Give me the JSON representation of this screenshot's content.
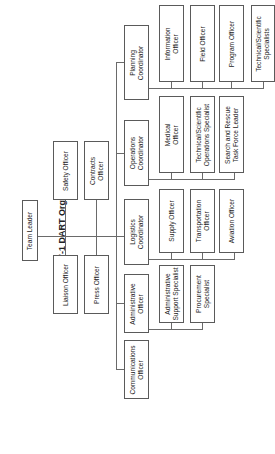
{
  "title": "Figure 7-1 DART Organization",
  "nodes": {
    "team_leader": "Team Leader",
    "liaison_officer": "Liaison Officer",
    "safety_officer": "Safety Officer",
    "press_officer": "Press Officer",
    "contracts_officer": "Contracts\nOfficer",
    "communications_officer": "Communications\nOfficer",
    "administrative_officer": "Administrative\nOfficer",
    "logistics_coordinator": "Logistics\nCoordinator",
    "operations_coordinator": "Operations\nCoordinator",
    "planning_coordinator": "Planning\nCoordinator",
    "admin_support_specialist": "Administrative\nSupport Specialist",
    "procurement_specialist": "Procurement\nSpecialist",
    "supply_officer": "Supply Officer",
    "transportation_officer": "Transportation\nOfficer",
    "aviation_officer": "Aviation Officer",
    "medical_officer": "Medical\nOfficer",
    "tech_sci_ops_specialist": "Technical/Scientific\nOperations Specialist",
    "sar_task_force_leader": "Search and Rescue\nTask Force Leader",
    "information_officer": "Information\nOfficer",
    "field_officer": "Field Officer",
    "program_officer": "Program Officer",
    "tech_sci_specialists": "Technical/Scientific\nSpecialists"
  },
  "hierarchy": {
    "root": "team_leader",
    "staff": [
      "liaison_officer",
      "safety_officer",
      "press_officer",
      "contracts_officer"
    ],
    "direct_reports": [
      "communications_officer",
      "administrative_officer",
      "logistics_coordinator",
      "operations_coordinator",
      "planning_coordinator"
    ],
    "children": {
      "administrative_officer": [
        "admin_support_specialist",
        "procurement_specialist"
      ],
      "logistics_coordinator": [
        "supply_officer",
        "transportation_officer",
        "aviation_officer"
      ],
      "operations_coordinator": [
        "medical_officer",
        "tech_sci_ops_specialist",
        "sar_task_force_leader"
      ],
      "planning_coordinator": [
        "information_officer",
        "field_officer",
        "program_officer",
        "tech_sci_specialists"
      ]
    }
  }
}
